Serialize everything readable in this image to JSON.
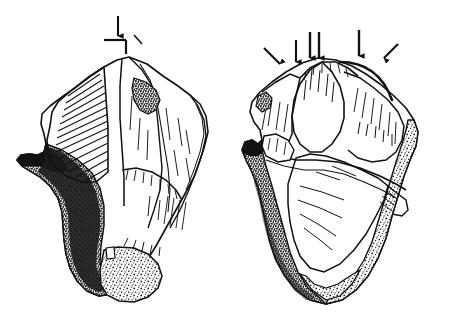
{
  "figure": {
    "kind": "line-drawing",
    "background_color": "#ffffff",
    "ink_color": "#111111",
    "title": "",
    "caption": "",
    "panels": [
      {
        "id": "left-view",
        "name": "left-artifact-view",
        "label": "",
        "annotation_count": 1,
        "annotations": [
          {
            "id": "left-arrow-1",
            "name": "impact-arrow-down",
            "type": "arrow",
            "direction": "down",
            "x": 118,
            "y": 16,
            "length": 22,
            "label": ""
          },
          {
            "id": "left-angle-mark",
            "name": "angle-tick-mark",
            "type": "angle-mark",
            "x": 112,
            "y": 38,
            "label": ""
          }
        ]
      },
      {
        "id": "right-view",
        "name": "right-artifact-view",
        "label": "",
        "annotation_count": 5,
        "annotations": [
          {
            "id": "right-arrow-1",
            "name": "impact-arrow-diagonal-left",
            "type": "arrow",
            "direction": "down-right",
            "x": 272,
            "y": 56,
            "length": 18,
            "label": ""
          },
          {
            "id": "right-arrow-2",
            "name": "impact-arrow-down-a",
            "type": "arrow",
            "direction": "down",
            "x": 298,
            "y": 44,
            "length": 20,
            "label": ""
          },
          {
            "id": "right-arrow-3",
            "name": "impact-arrow-down-b",
            "type": "arrow",
            "direction": "down",
            "x": 311,
            "y": 40,
            "length": 22,
            "label": ""
          },
          {
            "id": "right-arrow-4",
            "name": "impact-arrow-down-c",
            "type": "arrow",
            "direction": "down",
            "x": 319,
            "y": 40,
            "length": 22,
            "label": ""
          },
          {
            "id": "right-arrow-5",
            "name": "impact-arrow-down-right-main",
            "type": "arrow",
            "direction": "down",
            "x": 358,
            "y": 35,
            "length": 24,
            "label": ""
          },
          {
            "id": "right-arrow-6",
            "name": "impact-arrow-diagonal-right",
            "type": "arrow",
            "direction": "down-left",
            "x": 390,
            "y": 48,
            "length": 18,
            "label": ""
          },
          {
            "id": "right-arc",
            "name": "ridge-arc-line",
            "type": "arc",
            "x": 340,
            "y": 60,
            "label": ""
          }
        ]
      }
    ],
    "textures": {
      "hatching": "parallel-line-shading",
      "stipple": "dot-stipple-cortex",
      "dark_edge": "solid-black-margin"
    }
  }
}
